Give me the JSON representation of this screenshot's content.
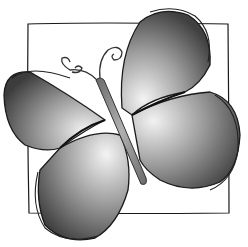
{
  "image": {
    "subject": "butterfly illustration",
    "style": "grayscale watercolor",
    "elements": [
      "square frame",
      "upper-left wing",
      "upper-right wing",
      "lower-left wing",
      "lower-right wing",
      "body",
      "antennae"
    ]
  },
  "colors": {
    "background": "#ffffff",
    "outline": "#1a1a1a",
    "wing_dark": "#3a3a3a",
    "wing_mid": "#8a8a8a",
    "wing_light": "#e8e8e8",
    "body": "#8c8c8c"
  }
}
